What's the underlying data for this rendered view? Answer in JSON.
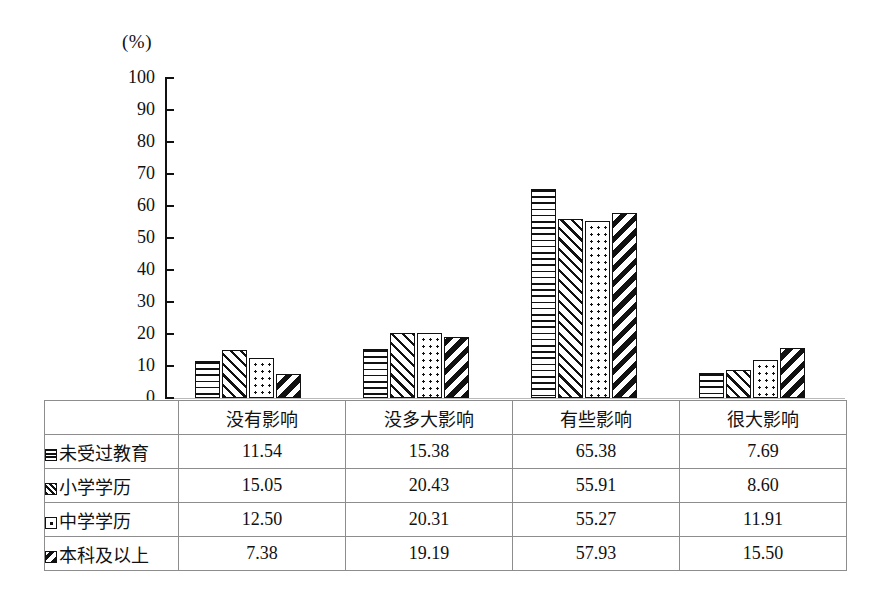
{
  "chart_data": {
    "type": "bar",
    "title": "",
    "xlabel": "",
    "ylabel": "(%)",
    "ylim": [
      0,
      100
    ],
    "ytick_step": 10,
    "yticks": [
      "100",
      "90",
      "80",
      "70",
      "60",
      "50",
      "40",
      "30",
      "20",
      "10",
      "0"
    ],
    "grid": false,
    "legend_position": "table-left-column",
    "categories": [
      "没有影响",
      "没多大影响",
      "有些影响",
      "很大影响"
    ],
    "series": [
      {
        "name": "未受过教育",
        "pattern": "horizontal-lines",
        "values": [
          11.54,
          15.38,
          65.38,
          7.69
        ]
      },
      {
        "name": "小学学历",
        "pattern": "diagonal-hatch",
        "values": [
          15.05,
          20.43,
          55.91,
          8.6
        ]
      },
      {
        "name": "中学学历",
        "pattern": "dots",
        "values": [
          12.5,
          20.31,
          55.27,
          11.91
        ]
      },
      {
        "name": "本科及以上",
        "pattern": "bold-diagonal",
        "values": [
          7.38,
          19.19,
          57.93,
          15.5
        ]
      }
    ],
    "value_labels": [
      [
        "11.54",
        "15.38",
        "65.38",
        "7.69"
      ],
      [
        "15.05",
        "20.43",
        "55.91",
        "8.60"
      ],
      [
        "12.50",
        "20.31",
        "55.27",
        "11.91"
      ],
      [
        "7.38",
        "19.19",
        "57.93",
        "15.50"
      ]
    ]
  },
  "axis": {
    "unit_label": "(%)",
    "ticks": [
      "100",
      "90",
      "80",
      "70",
      "60",
      "50",
      "40",
      "30",
      "20",
      "10",
      "0"
    ]
  },
  "table": {
    "header_row": [
      "",
      "没有影响",
      "没多大影响",
      "有些影响",
      "很大影响"
    ],
    "rows": [
      {
        "legend": "未受过教育",
        "swatch": "horizontal-lines-swatch",
        "cells": [
          "11.54",
          "15.38",
          "65.38",
          "7.69"
        ]
      },
      {
        "legend": "小学学历",
        "swatch": "diagonal-hatch-swatch",
        "cells": [
          "15.05",
          "20.43",
          "55.91",
          "8.60"
        ]
      },
      {
        "legend": "中学学历",
        "swatch": "dots-swatch",
        "cells": [
          "12.50",
          "20.31",
          "55.27",
          "11.91"
        ]
      },
      {
        "legend": "本科及以上",
        "swatch": "bold-diagonal-swatch",
        "cells": [
          "7.38",
          "19.19",
          "57.93",
          "15.50"
        ]
      }
    ]
  },
  "colors": {
    "ink": "#111111",
    "grid_line": "#8d8d8d",
    "background": "#ffffff"
  }
}
